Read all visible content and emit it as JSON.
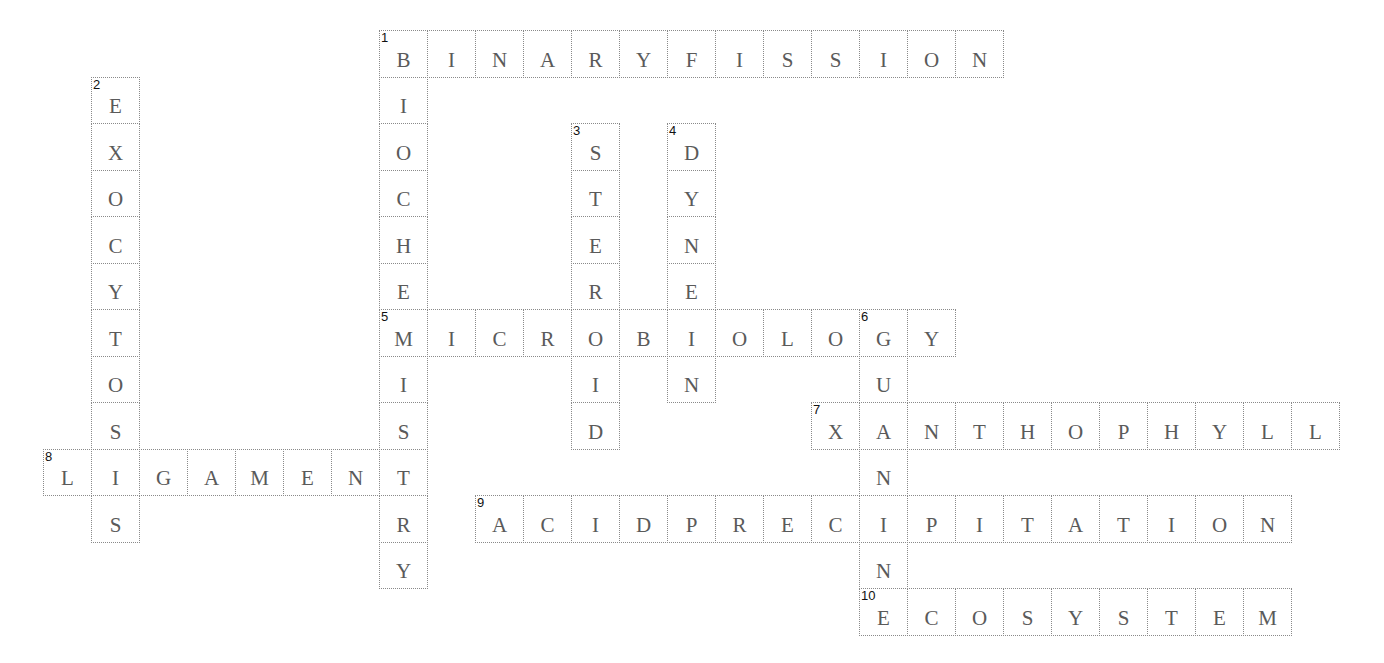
{
  "puzzle": {
    "type": "crossword",
    "layout": {
      "origin_x": 43,
      "origin_y": 30,
      "cell_width": 48,
      "cell_height": 46.5
    },
    "colors": {
      "background": "#ffffff",
      "border": "#8a8a8a",
      "letter": "#5a5a5a",
      "number": "#111111"
    },
    "entries": [
      {
        "number": 1,
        "direction": "across",
        "answer": "BINARYFISSION",
        "row": 0,
        "col": 7
      },
      {
        "number": 1,
        "direction": "down",
        "answer": "BIOCHEMISTRY",
        "row": 0,
        "col": 7
      },
      {
        "number": 2,
        "direction": "down",
        "answer": "EXOCYTOSIS",
        "row": 1,
        "col": 1
      },
      {
        "number": 3,
        "direction": "down",
        "answer": "STEROID",
        "row": 2,
        "col": 11
      },
      {
        "number": 4,
        "direction": "down",
        "answer": "DYNEIN",
        "row": 2,
        "col": 13
      },
      {
        "number": 5,
        "direction": "across",
        "answer": "MICROBIOLOGY",
        "row": 6,
        "col": 7
      },
      {
        "number": 6,
        "direction": "down",
        "answer": "GUANINE",
        "row": 6,
        "col": 17
      },
      {
        "number": 7,
        "direction": "across",
        "answer": "XANTHOPHYLL",
        "row": 8,
        "col": 16
      },
      {
        "number": 8,
        "direction": "across",
        "answer": "LIGAMENT",
        "row": 9,
        "col": 0
      },
      {
        "number": 9,
        "direction": "across",
        "answer": "ACIDPRECIPITATION",
        "row": 10,
        "col": 9
      },
      {
        "number": 10,
        "direction": "across",
        "answer": "ECOSYSTEM",
        "row": 12,
        "col": 17
      }
    ]
  }
}
